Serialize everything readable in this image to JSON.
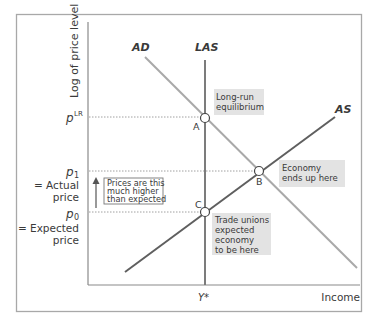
{
  "axes": {
    "y_label": "Log of price level",
    "x_label": "Income",
    "x_tick": "Y*"
  },
  "curves": {
    "ad": "AD",
    "las": "LAS",
    "as": "AS"
  },
  "price_levels": {
    "p_lr": "p",
    "p_lr_sup": "LR",
    "p1": "p",
    "p1_sub": "1",
    "p1_desc_line1": "= Actual",
    "p1_desc_line2": "price",
    "p0": "p",
    "p0_sub": "0",
    "p0_desc_line1": "= Expected",
    "p0_desc_line2": "price"
  },
  "points": {
    "a": "A",
    "b": "B",
    "c": "C"
  },
  "annotations": {
    "long_run": [
      "Long-run",
      "equilibrium"
    ],
    "economy_ends": [
      "Economy",
      "ends up here"
    ],
    "trade_unions": [
      "Trade unions",
      "expected",
      "economy",
      "to be here"
    ],
    "price_gap": [
      "Prices are this",
      "much higher",
      "than expected"
    ]
  },
  "colors": {
    "frame": "#a8a8a8",
    "axis": "#8a8a8a",
    "ad_line": "#a9a9a9",
    "las_line": "#7c7c7c",
    "as_line": "#5f5f5f",
    "annotation_bg": "#e3e3e3",
    "text": "#3a3a3a"
  }
}
